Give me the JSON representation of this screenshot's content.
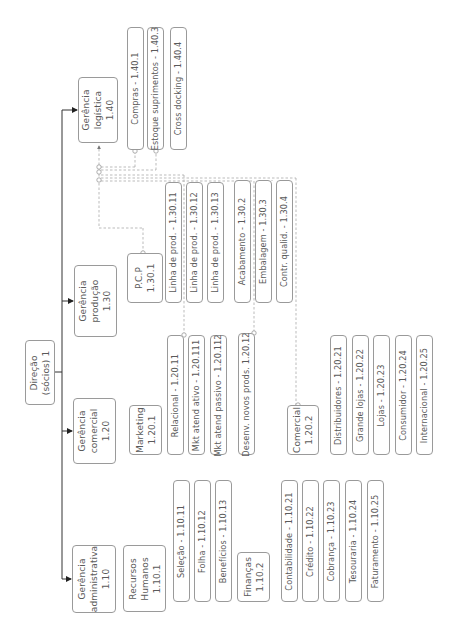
{
  "diagram": {
    "orientation": "rotated-90-ccw",
    "colors": {
      "box_border": "#9a9a9a",
      "text": "#5a5a5a",
      "solid_line": "#333333",
      "dashed_line": "#a8a8a8"
    },
    "root": {
      "label": "Direção\n(sócios) 1"
    },
    "departments": [
      {
        "id": "adm",
        "label": "Gerência\nadministrativa\n1.10",
        "units": [
          {
            "id": "rh",
            "label": "Recursos\nHumanos\n1.10.1",
            "items": [
              "Seleção - 1.10.11",
              "Folha - 1.10.12",
              "Benefícios - 1.10.13"
            ]
          },
          {
            "id": "fin",
            "label": "Finanças\n1.10.2",
            "items": [
              "Contabilidade - 1.10.21",
              "Crédito - 1.10.22",
              "Cobrança - 1.10.23",
              "Tesouraria - 1.10.24",
              "Faturamento - 1.10.25"
            ]
          }
        ]
      },
      {
        "id": "com",
        "label": "Gerência\ncomercial\n1.20",
        "units": [
          {
            "id": "mkt",
            "label": "Marketing\n1.20.1",
            "items": [
              "Relacional - 1.20.11",
              "Mkt atend ativo - 1.20.111",
              "Mkt atend passivo - 1.20.112",
              "Desenv. novos prods. 1.20.12"
            ]
          },
          {
            "id": "comercial",
            "label": "Comercial\n1.20.2",
            "items": [
              "Distribuidores - 1.20.21",
              "Grande lojas - 1.20.22",
              "Lojas - 1.20.23",
              "Consumidor - 1.20.24",
              "Internacional - 1.20.25"
            ]
          }
        ]
      },
      {
        "id": "prod",
        "label": "Gerência\nprodução\n1.30",
        "units": [
          {
            "id": "pcp",
            "label": "P.C.P\n1.30.1",
            "items": [
              "Linha de prod. - 1.30.11",
              "Linha de prod. - 1.30.12",
              "Linha de prod. - 1.30.13"
            ]
          },
          {
            "id": "prod_other",
            "label": "",
            "items": [
              "Acabamento - 1.30.2",
              "Embalagem - 1.30.3",
              "Contr. qualid. - 1.30.4"
            ]
          }
        ]
      },
      {
        "id": "log",
        "label": "Gerência\nlogística\n1.40",
        "units": [
          {
            "id": "log_items",
            "label": "",
            "items": [
              "Compras - 1.40.1",
              "Estoque suprimentos - 1.40.3",
              "Cross docking - 1.40.4"
            ]
          }
        ]
      }
    ]
  }
}
